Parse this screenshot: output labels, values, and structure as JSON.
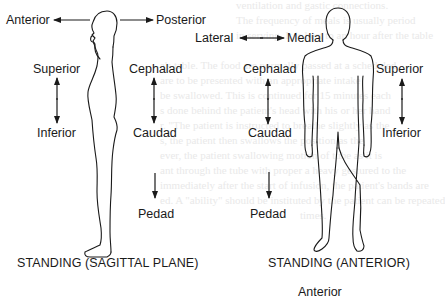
{
  "figure_left": {
    "caption": "STANDING (SAGITTAL PLANE)",
    "labels": {
      "anterior": "Anterior",
      "posterior": "Posterior",
      "superior": "Superior",
      "inferior": "Inferior",
      "cephalad": "Cephalad",
      "caudad": "Caudad",
      "pedad": "Pedad"
    }
  },
  "figure_right": {
    "caption": "STANDING (ANTERIOR)",
    "labels": {
      "lateral": "Lateral",
      "medial": "Medial",
      "cephalad": "Cephalad",
      "caudad": "Caudad",
      "pedad": "Pedad",
      "superior": "Superior",
      "inferior": "Inferior"
    }
  },
  "next_figure_partial_label": "Anterior",
  "colors": {
    "ink": "#1a1a1a",
    "background": "#ffffff",
    "bleed_through": "#e9e9e9"
  }
}
